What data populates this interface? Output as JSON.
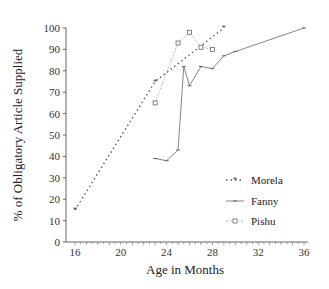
{
  "chart_data": {
    "type": "line",
    "title": "",
    "xlabel": "Age in Months",
    "ylabel": "% of Obligatory Article Supplied",
    "xlim": [
      16,
      36
    ],
    "ylim": [
      0,
      100
    ],
    "x_ticks": [
      16,
      20,
      24,
      28,
      32,
      36
    ],
    "y_ticks": [
      0,
      10,
      20,
      30,
      40,
      50,
      60,
      70,
      80,
      90,
      100
    ],
    "grid": false,
    "legend_position": "right-middle",
    "series": [
      {
        "name": "Morela",
        "style": "dotted",
        "marker": "star",
        "x": [
          16,
          23,
          29
        ],
        "y": [
          15,
          75,
          100
        ]
      },
      {
        "name": "Fanny",
        "style": "solid",
        "marker": "dash",
        "x": [
          23,
          24,
          25,
          25.5,
          26,
          27,
          28,
          29,
          30,
          36
        ],
        "y": [
          39,
          38,
          43,
          82,
          73,
          82,
          81,
          87,
          89,
          100
        ]
      },
      {
        "name": "Pishu",
        "style": "dotted-light",
        "marker": "open-square",
        "x": [
          23,
          25,
          26,
          27,
          28
        ],
        "y": [
          65,
          93,
          98,
          91,
          90
        ]
      }
    ]
  },
  "legend": {
    "items": [
      {
        "label": "Morela"
      },
      {
        "label": "Fanny"
      },
      {
        "label": "Pishu"
      }
    ]
  }
}
